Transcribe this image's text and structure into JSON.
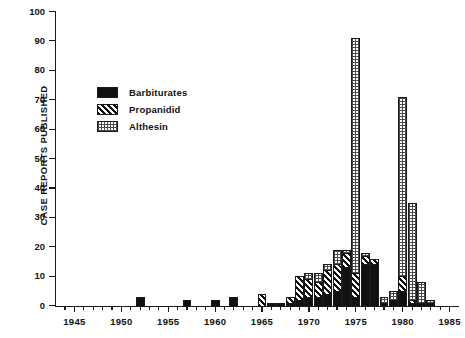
{
  "chart_data": {
    "type": "bar",
    "stacked": true,
    "title": "",
    "xlabel": "",
    "ylabel": "CASE REPORTS PUBLISHED",
    "ylim": [
      0,
      100
    ],
    "ytick_step": 10,
    "yticks": [
      0,
      10,
      20,
      30,
      40,
      50,
      60,
      70,
      80,
      90,
      100
    ],
    "xlim": [
      1943,
      1986
    ],
    "xticks_major": [
      1945,
      1950,
      1955,
      1960,
      1965,
      1970,
      1975,
      1980,
      1985
    ],
    "xtick_minor_step": 1,
    "grid": false,
    "legend_position": "upper-left",
    "categories": [
      1944,
      1945,
      1946,
      1947,
      1948,
      1949,
      1950,
      1951,
      1952,
      1953,
      1954,
      1955,
      1956,
      1957,
      1958,
      1959,
      1960,
      1961,
      1962,
      1963,
      1964,
      1965,
      1966,
      1967,
      1968,
      1969,
      1970,
      1971,
      1972,
      1973,
      1974,
      1975,
      1976,
      1977,
      1978,
      1979,
      1980,
      1981,
      1982,
      1983,
      1984,
      1985
    ],
    "series": [
      {
        "name": "Barbiturates",
        "color": "#111111",
        "pattern": "solid-black",
        "values": [
          0,
          0,
          0,
          0,
          0,
          0,
          0,
          0,
          3,
          0,
          0,
          0,
          0,
          2,
          0,
          0,
          2,
          0,
          3,
          0,
          0,
          0,
          1,
          1,
          1,
          2,
          3,
          3,
          4,
          5,
          13,
          3,
          14,
          14,
          1,
          2,
          5,
          1,
          1,
          1,
          0,
          0
        ]
      },
      {
        "name": "Propanidid",
        "color": "#111111",
        "pattern": "diagonal-hatch",
        "values": [
          0,
          0,
          0,
          0,
          0,
          0,
          0,
          0,
          0,
          0,
          0,
          0,
          0,
          0,
          0,
          0,
          0,
          0,
          0,
          0,
          0,
          4,
          0,
          0,
          2,
          8,
          6,
          5,
          8,
          9,
          5,
          8,
          3,
          2,
          0,
          0,
          5,
          1,
          0,
          0,
          0,
          0
        ]
      },
      {
        "name": "Althesin",
        "color": "#4a4a4a",
        "pattern": "fine-dot-grid",
        "values": [
          0,
          0,
          0,
          0,
          0,
          0,
          0,
          0,
          0,
          0,
          0,
          0,
          0,
          0,
          0,
          0,
          0,
          0,
          0,
          0,
          0,
          0,
          0,
          0,
          0,
          0,
          2,
          3,
          2,
          5,
          1,
          80,
          1,
          0,
          2,
          3,
          61,
          33,
          7,
          1,
          0,
          0
        ]
      }
    ],
    "totals": [
      0,
      0,
      0,
      0,
      0,
      0,
      0,
      0,
      3,
      0,
      0,
      0,
      0,
      2,
      0,
      0,
      2,
      0,
      3,
      0,
      0,
      4,
      1,
      1,
      3,
      10,
      11,
      11,
      14,
      19,
      19,
      91,
      18,
      16,
      3,
      5,
      71,
      35,
      8,
      2,
      0,
      0
    ]
  },
  "legend": {
    "items": [
      {
        "label": "Barbiturates",
        "swatch": "solid-black"
      },
      {
        "label": "Propanidid",
        "swatch": "diagonal-hatch"
      },
      {
        "label": "Althesin",
        "swatch": "fine-dot-grid"
      }
    ]
  },
  "axes": {
    "y_title": "CASE REPORTS PUBLISHED",
    "y_tick_labels": [
      "0",
      "10",
      "20",
      "30",
      "40",
      "50",
      "60",
      "70",
      "80",
      "90",
      "100"
    ],
    "x_tick_labels": [
      "1945",
      "1950",
      "1955",
      "1960",
      "1965",
      "1970",
      "1975",
      "1980",
      "1985"
    ]
  },
  "caption": ""
}
